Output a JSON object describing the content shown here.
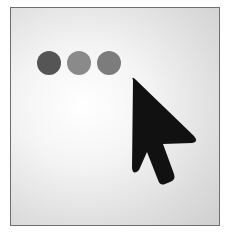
{
  "icon": {
    "name": "cursor-click-icon",
    "dots": [
      {
        "name": "dot-1",
        "color": "#555555"
      },
      {
        "name": "dot-2",
        "color": "#8a8a8a"
      },
      {
        "name": "dot-3",
        "color": "#7c7c7c"
      }
    ],
    "pointer_color": "#111111",
    "frame_border": "#6e6e6e"
  }
}
